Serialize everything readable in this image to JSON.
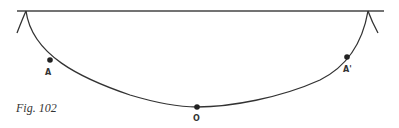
{
  "figure": {
    "caption": "Fig. 102",
    "points": [
      {
        "id": "A",
        "label": "A"
      },
      {
        "id": "O",
        "label": "O"
      },
      {
        "id": "A_prime",
        "label": "A'"
      }
    ],
    "colors": {
      "stroke": "#333333",
      "background": "#ffffff"
    }
  }
}
